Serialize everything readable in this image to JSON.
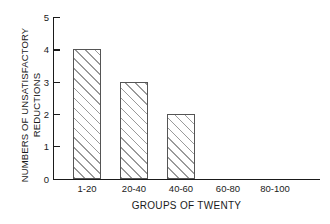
{
  "chart_data": {
    "type": "bar",
    "title": "",
    "xlabel": "GROUPS OF TWENTY",
    "ylabel_line1": "NUMBERS OF UNSATISFACTORY",
    "ylabel_line2": "REDUCTIONS",
    "categories": [
      "1-20",
      "20-40",
      "40-60",
      "60-80",
      "80-100"
    ],
    "values": [
      4,
      3,
      2,
      0,
      0
    ],
    "ylim": [
      0,
      5
    ],
    "yticks": [
      0,
      1,
      2,
      3,
      4,
      5
    ],
    "ytick_labels": [
      "0",
      "1",
      "2",
      "3",
      "4",
      "5"
    ],
    "grid": false,
    "legend": "none",
    "bar_fill": "#ffffff",
    "bar_edge": "#555555",
    "hatch": "diagonal-45",
    "axis_color": "#1a1a1a",
    "background": "#ffffff"
  },
  "yticks": {
    "t0": "0",
    "t1": "1",
    "t2": "2",
    "t3": "3",
    "t4": "4",
    "t5": "5"
  },
  "xticks": {
    "c0": "1-20",
    "c1": "20-40",
    "c2": "40-60",
    "c3": "60-80",
    "c4": "80-100"
  },
  "axis_titles": {
    "x": "GROUPS OF TWENTY",
    "y_line1": "NUMBERS OF UNSATISFACTORY",
    "y_line2": "REDUCTIONS"
  }
}
